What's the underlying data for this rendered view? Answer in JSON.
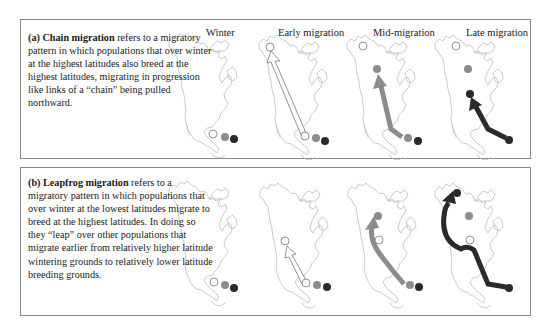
{
  "figure": {
    "stages": [
      "Winter",
      "Early migration",
      "Mid-migration",
      "Late migration"
    ],
    "colors": {
      "open_circle": "#ffffff",
      "grey_population": "#8c8c8c",
      "black_population": "#2a2a2a",
      "map_outline": "#bdbdbd",
      "border": "#8a8a8a"
    }
  },
  "panel_a": {
    "label": "(a)",
    "term": "Chain migration",
    "text": " refers to a migratory pattern in which populations that over winter at the highest latitudes also breed at the highest latitudes, migrating in progression like links of a “chain” being pulled northward."
  },
  "panel_b": {
    "label": "(b)",
    "term": "Leapfrog migration",
    "text": " refers to a migratory pattern in which populations that over winter at the lowest latitudes migrate to breed at the highest latitudes. In doing so they “leap” over other populations that migrate earlier from relatively higher latitude wintering grounds to relatively lower latitude breeding grounds."
  }
}
